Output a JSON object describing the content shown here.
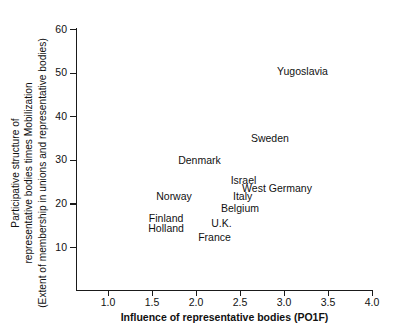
{
  "chart_data": {
    "type": "scatter",
    "title": "",
    "xlabel": "Influence of representative bodies (PO1F)",
    "ylabel_lines": [
      "Participative structure of",
      "representative bodies times Mobilization",
      "(Extent of membership in unions and representative bodies)"
    ],
    "xlim": [
      0.75,
      4.15
    ],
    "ylim": [
      0,
      62
    ],
    "xticks": [
      1.0,
      1.5,
      2.0,
      2.5,
      3.0,
      3.5,
      4.0
    ],
    "xtick_labels": [
      "1.0",
      "1.5",
      "2.0",
      "2.5",
      "3.0",
      "3.5",
      "4.0"
    ],
    "yticks": [
      10,
      20,
      30,
      40,
      50,
      60
    ],
    "ytick_labels": [
      "10",
      "20",
      "30",
      "40",
      "50",
      "60"
    ],
    "grid": false,
    "legend": "none",
    "marker_style": "text-label-only",
    "points": [
      {
        "label": "Yugoslavia",
        "x": 3.21,
        "y": 50.3
      },
      {
        "label": "Sweden",
        "x": 2.84,
        "y": 35.0
      },
      {
        "label": "Denmark",
        "x": 2.04,
        "y": 30.0
      },
      {
        "label": "Israel",
        "x": 2.54,
        "y": 25.3
      },
      {
        "label": "West Germany",
        "x": 2.92,
        "y": 23.5
      },
      {
        "label": "Norway",
        "x": 1.75,
        "y": 21.8
      },
      {
        "label": "Italy",
        "x": 2.53,
        "y": 21.6
      },
      {
        "label": "Belgium",
        "x": 2.5,
        "y": 19.0
      },
      {
        "label": "Finland",
        "x": 1.66,
        "y": 16.6
      },
      {
        "label": "U.K.",
        "x": 2.29,
        "y": 15.6
      },
      {
        "label": "Holland",
        "x": 1.66,
        "y": 14.3
      },
      {
        "label": "France",
        "x": 2.21,
        "y": 12.4
      }
    ]
  },
  "axes": {
    "x_tick_pixel_origin": 108,
    "x_pixels_per_unit": 88,
    "y_tick_pixel_for_10": 247,
    "y_pixels_per_unit": 4.36
  }
}
